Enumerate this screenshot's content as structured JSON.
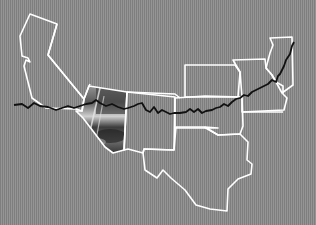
{
  "map": {
    "colors": {
      "background": "#8a8a8a",
      "state_outline": "#ffffff",
      "route_line": "#111111"
    },
    "states": [
      {
        "name": "california",
        "points": "30,14 57,24 48,55 84,99 82,111 76,109 46,108 32,98 28,82 24,66 26,60 30,62 28,58 22,56 20,36"
      },
      {
        "name": "nevada",
        "points": "57,24 48,55 84,99 89,86 90,84"
      },
      {
        "name": "arizona",
        "points": "89,86 127,92 124,150 113,153 105,147 96,135 83,118 76,111 82,111 84,99"
      },
      {
        "name": "utah-colorado-line",
        "points": "127,92 175,94 180,98"
      },
      {
        "name": "new-mexico",
        "points": "127,92 175,97 174,150 144,149 143,153 128,149 124,150"
      },
      {
        "name": "texas",
        "points": "174,150 176,127 204,127 218,135 240,134 248,142 247,160 252,164 251,174 238,179 228,189 227,211 210,209 196,205 185,190 171,178 163,170 157,178 145,170 143,153 144,149"
      },
      {
        "name": "oklahoma",
        "points": "175,98 175,128 218,128 205,127 218,135 240,134 243,126 242,97 205,96"
      },
      {
        "name": "kansas",
        "points": "185,65 235,65 240,72 238,97 185,97"
      },
      {
        "name": "missouri",
        "points": "233,60 265,59 266,68 272,75 276,82 283,86 283,94 287,98 284,110 263,111 242,112 242,97 240,72"
      },
      {
        "name": "illinois",
        "points": "270,38 292,37 293,85 282,93 276,82 272,75 266,68 270,53 273,45"
      },
      {
        "name": "arkansas",
        "points": "243,112 283,112"
      }
    ],
    "route": {
      "name": "route-66",
      "points": "14,105 22,104 28,108 34,103 40,106 48,107 56,110 62,108 68,106 74,108 80,106 86,104 92,103 96,100 100,103 106,106 112,104 118,107 124,109 128,108 134,106 138,104 142,103 146,110 150,112 154,107 158,113 162,110 166,112 170,114 174,113 180,113 186,112 190,109 194,112 198,109 202,113 206,111 212,110 216,108 220,107 224,104 228,106 232,102 236,99 240,98 244,95 248,96 252,92 256,90 260,88 264,86 268,84 272,80 276,82 278,76 280,74 282,70 284,66 286,60 290,54 292,46 294,42"
    },
    "photo": {
      "region": "arizona",
      "description": "monochrome landscape photo clipped to Arizona outline"
    }
  }
}
